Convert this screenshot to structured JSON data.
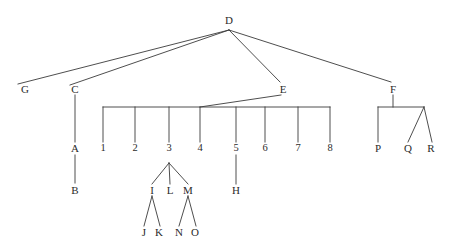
{
  "diagram": {
    "type": "tree",
    "title": "",
    "background_color": "#ffffff",
    "line_color": "#3a3a3a",
    "text_color": "#2b2b2b",
    "root": "D",
    "nodes": [
      {
        "id": "D",
        "label": "D",
        "x": 229,
        "y": 20
      },
      {
        "id": "G",
        "label": "G",
        "x": 25,
        "y": 89
      },
      {
        "id": "C",
        "label": "C",
        "x": 75,
        "y": 89
      },
      {
        "id": "E",
        "label": "E",
        "x": 283,
        "y": 89
      },
      {
        "id": "F",
        "label": "F",
        "x": 393,
        "y": 89
      },
      {
        "id": "A",
        "label": "A",
        "x": 75,
        "y": 148
      },
      {
        "id": "B",
        "label": "B",
        "x": 75,
        "y": 190
      },
      {
        "id": "N1",
        "label": "1",
        "x": 103,
        "y": 148
      },
      {
        "id": "N2",
        "label": "2",
        "x": 135,
        "y": 148
      },
      {
        "id": "N3",
        "label": "3",
        "x": 169,
        "y": 148
      },
      {
        "id": "N4",
        "label": "4",
        "x": 200,
        "y": 148
      },
      {
        "id": "N5",
        "label": "5",
        "x": 236,
        "y": 148
      },
      {
        "id": "N6",
        "label": "6",
        "x": 265,
        "y": 148
      },
      {
        "id": "N7",
        "label": "7",
        "x": 298,
        "y": 148
      },
      {
        "id": "N8",
        "label": "8",
        "x": 330,
        "y": 148
      },
      {
        "id": "I",
        "label": "I",
        "x": 152,
        "y": 190
      },
      {
        "id": "L",
        "label": "L",
        "x": 170,
        "y": 190
      },
      {
        "id": "M",
        "label": "M",
        "x": 188,
        "y": 190
      },
      {
        "id": "H",
        "label": "H",
        "x": 236,
        "y": 190
      },
      {
        "id": "J",
        "label": "J",
        "x": 144,
        "y": 232
      },
      {
        "id": "K",
        "label": "K",
        "x": 159,
        "y": 232
      },
      {
        "id": "N",
        "label": "N",
        "x": 179,
        "y": 232
      },
      {
        "id": "O",
        "label": "O",
        "x": 195,
        "y": 232
      },
      {
        "id": "P",
        "label": "P",
        "x": 378,
        "y": 148
      },
      {
        "id": "Q",
        "label": "Q",
        "x": 408,
        "y": 148
      },
      {
        "id": "R",
        "label": "R",
        "x": 431,
        "y": 148
      }
    ],
    "edges": [
      {
        "from": "D",
        "to": "G"
      },
      {
        "from": "D",
        "to": "C"
      },
      {
        "from": "D",
        "to": "E"
      },
      {
        "from": "D",
        "to": "F"
      },
      {
        "from": "C",
        "to": "A"
      },
      {
        "from": "A",
        "to": "B"
      },
      {
        "from": "E",
        "to": "1"
      },
      {
        "from": "E",
        "to": "2"
      },
      {
        "from": "E",
        "to": "3"
      },
      {
        "from": "E",
        "to": "4"
      },
      {
        "from": "E",
        "to": "5"
      },
      {
        "from": "E",
        "to": "6"
      },
      {
        "from": "E",
        "to": "7"
      },
      {
        "from": "E",
        "to": "8"
      },
      {
        "from": "3",
        "to": "I"
      },
      {
        "from": "3",
        "to": "L"
      },
      {
        "from": "3",
        "to": "M"
      },
      {
        "from": "I",
        "to": "J"
      },
      {
        "from": "I",
        "to": "K"
      },
      {
        "from": "M",
        "to": "N"
      },
      {
        "from": "M",
        "to": "O"
      },
      {
        "from": "5",
        "to": "H"
      },
      {
        "from": "F",
        "to": "P"
      },
      {
        "from": "F",
        "to": "Q"
      },
      {
        "from": "F",
        "to": "R"
      }
    ]
  }
}
